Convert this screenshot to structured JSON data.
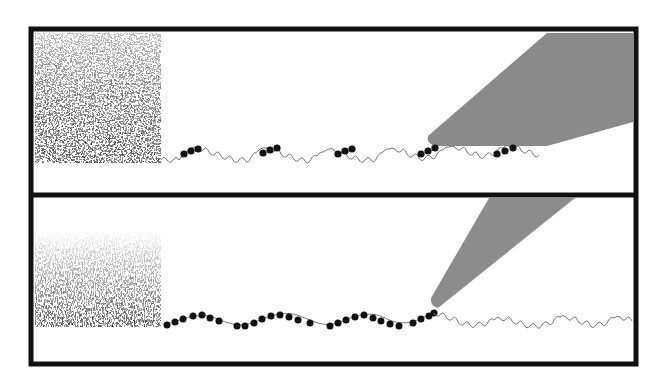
{
  "figure": {
    "colors": {
      "frame": "#111111",
      "background": "#ffffff",
      "probe_top": "#8a8a8a",
      "probe_bottom": "#8c8c8c",
      "bead": "#111111",
      "thread": "#777777"
    },
    "panels": [
      {
        "id": "top",
        "block_texture": "coarse-stipple",
        "probe_shape": "wide-wedge",
        "bead_clusters": 5
      },
      {
        "id": "bottom",
        "block_texture": "fine-stipple-gradient",
        "probe_shape": "narrow-cone",
        "bead_clusters": "continuous-until-probe"
      }
    ]
  }
}
